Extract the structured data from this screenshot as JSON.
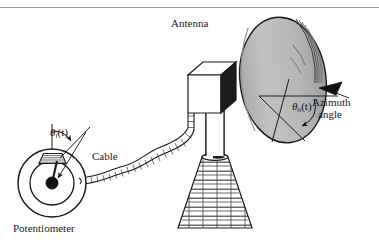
{
  "figure": {
    "background_color": "#ffffff",
    "width": 379,
    "height": 249,
    "top_rule_color": "#9a9a9a"
  },
  "labels": {
    "antenna": "Antenna",
    "cable": "Cable",
    "potentiometer": "Potentiometer",
    "azimuth_line1": "Azimuth",
    "azimuth_line2": "angle"
  },
  "symbols": {
    "input_angle": {
      "base": "θ",
      "subscript": "i",
      "arg": "(t)"
    },
    "output_angle": {
      "base": "θ",
      "subscript": "o",
      "arg": "(t)"
    }
  },
  "colors": {
    "outline": "#1a1a1a",
    "dish_face": "#b9b9b9",
    "dish_rim_shadow": "#8f8f8f",
    "pedestal_fill": "#ffffff",
    "brick_line": "#2b2b2b",
    "pointer_fill": "#111111",
    "hub_fill": "#111111",
    "cable_fill": "#ffffff",
    "box_face_light": "#ffffff",
    "box_face_dark": "#1c1c1c",
    "text": "#1a1a1a"
  },
  "parts": [
    {
      "name": "potentiometer",
      "shape": "concentric-circles-with-wiper",
      "description": "Rotary potentiometer with outer ring, inner disc, black hub and wiper arm, hatched resistive arc at top"
    },
    {
      "name": "cable",
      "shape": "wavy-hatched-band",
      "description": "Flexible hatched cable running from potentiometer to motor housing"
    },
    {
      "name": "motor-housing",
      "shape": "isometric-box",
      "description": "Rectangular drive housing behind the dish"
    },
    {
      "name": "mast",
      "shape": "vertical-column",
      "description": "Vertical support column between housing and pedestal"
    },
    {
      "name": "pedestal",
      "shape": "brick-truncated-cone",
      "description": "Brick-patterned conical base"
    },
    {
      "name": "dish",
      "shape": "tilted-ellipse",
      "description": "Parabolic antenna dish with gray face and curved ridge lines at the rim"
    },
    {
      "name": "azimuth-indicator",
      "shape": "crossed-axes-with-arc",
      "description": "Horizontal reference axis, rotated axis, curved arrow and black wedge pointer"
    }
  ]
}
